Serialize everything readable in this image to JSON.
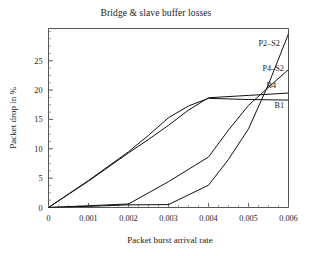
{
  "chart_data": {
    "type": "line",
    "title": "Bridge & slave buffer losses",
    "xlabel": "Packet burst arrival rate",
    "ylabel": "Packet drop in %",
    "xlim": [
      0,
      0.006
    ],
    "ylim": [
      0,
      30.5
    ],
    "grid": false,
    "legend_position": "inline-right-end-of-line",
    "xticks": [
      0,
      0.001,
      0.002,
      0.003,
      0.004,
      0.005,
      0.006
    ],
    "xticklabels": [
      "0",
      "0.001",
      "0.002",
      "0.003",
      "0.004",
      "0.005",
      "0.006"
    ],
    "yticks": [
      0,
      5,
      10,
      15,
      20,
      25
    ],
    "yticklabels": [
      "0",
      "5",
      "10",
      "15",
      "20",
      "25"
    ],
    "x_minor_tick_step": 0.00025,
    "y_minor_tick_step": 1.25,
    "line_color": "#111111",
    "series": [
      {
        "name": "B1",
        "label": "B1",
        "x": [
          0,
          0.001,
          0.002,
          0.0025,
          0.003,
          0.0035,
          0.004,
          0.005,
          0.006
        ],
        "values": [
          0,
          4.6,
          9.5,
          12.3,
          15.3,
          17.3,
          18.6,
          18.4,
          18.3
        ]
      },
      {
        "name": "B4",
        "label": "B4",
        "x": [
          0,
          0.001,
          0.002,
          0.0025,
          0.003,
          0.0035,
          0.004,
          0.005,
          0.006
        ],
        "values": [
          0,
          4.5,
          9.3,
          11.6,
          14.0,
          16.6,
          18.7,
          19.1,
          19.5
        ]
      },
      {
        "name": "P4-S2",
        "label": "P4–S2",
        "x": [
          0,
          0.001,
          0.002,
          0.003,
          0.004,
          0.0045,
          0.005,
          0.0055,
          0.006
        ],
        "values": [
          0,
          0.3,
          0.6,
          4.4,
          8.6,
          13.2,
          17.4,
          20.5,
          23.5
        ]
      },
      {
        "name": "P2-S2",
        "label": "P2–S2",
        "x": [
          0,
          0.001,
          0.002,
          0.003,
          0.004,
          0.0045,
          0.005,
          0.0055,
          0.006
        ],
        "values": [
          0,
          0.2,
          0.45,
          0.5,
          3.8,
          8.2,
          13.4,
          21.0,
          29.6
        ]
      }
    ],
    "annotations": [
      {
        "text": "P2–S2",
        "x": 0.00525,
        "y": 27.6
      },
      {
        "text": "P4–S2",
        "x": 0.00535,
        "y": 23.2
      },
      {
        "text": "B4",
        "x": 0.00545,
        "y": 20.3
      },
      {
        "text": "B1",
        "x": 0.00565,
        "y": 17.0
      }
    ]
  }
}
